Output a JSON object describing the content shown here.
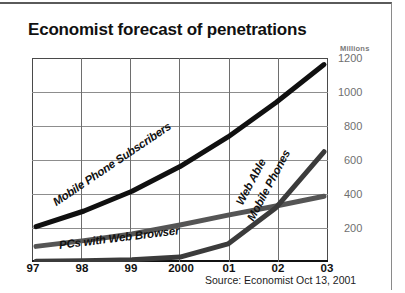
{
  "chart_data": {
    "type": "line",
    "title": "Economist forecast of penetrations",
    "ylabel": "Millions",
    "xlabel": "",
    "units_label": "Millions",
    "grid": true,
    "legend_position": "inline-labels",
    "x": [
      "97",
      "98",
      "99",
      "2000",
      "01",
      "02",
      "03"
    ],
    "xtick_labels": [
      "97",
      "98",
      "99",
      "2000",
      "01",
      "02",
      "03"
    ],
    "ytick_labels": [
      "1200",
      "1000",
      "800",
      "600",
      "400",
      "200"
    ],
    "ytick_values": [
      1200,
      1000,
      800,
      600,
      400,
      200
    ],
    "ylim": [
      0,
      1240
    ],
    "series": [
      {
        "name": "Mobile Phone Subscribers",
        "color": "#101010",
        "width": 5,
        "values": [
          215,
          310,
          430,
          580,
          760,
          970,
          1200
        ]
      },
      {
        "name": "PCs with Web Browser",
        "color": "#555555",
        "width": 5,
        "values": [
          95,
          130,
          170,
          225,
          285,
          340,
          400
        ]
      },
      {
        "name": "Web Able Mobile Phones",
        "color": "#3b3b3b",
        "width": 5,
        "values": [
          5,
          8,
          14,
          30,
          110,
          330,
          670
        ]
      }
    ],
    "annotations": [
      {
        "text": "Mobile Phone Subscribers",
        "rotation": -34
      },
      {
        "text": "Web Able",
        "rotation": -62
      },
      {
        "text": "Mobile Phones",
        "rotation": -62
      },
      {
        "text": "PCs with Web Browser",
        "rotation": -7
      }
    ],
    "source": "Source: Economist Oct 13, 2001"
  },
  "labels": {
    "title": "Economist forecast of penetrations",
    "units": "Millions",
    "source": "Source: Economist Oct 13, 2001",
    "series_mobile": "Mobile Phone Subscribers",
    "series_pcs": "PCs with Web Browser",
    "series_webable_line1": "Web Able",
    "series_webable_line2": "Mobile Phones",
    "y1200": "1200",
    "y1000": "1000",
    "y800": "800",
    "y600": "600",
    "y400": "400",
    "y200": "200",
    "x97": "97",
    "x98": "98",
    "x99": "99",
    "x2000": "2000",
    "x01": "01",
    "x02": "02",
    "x03": "03"
  }
}
